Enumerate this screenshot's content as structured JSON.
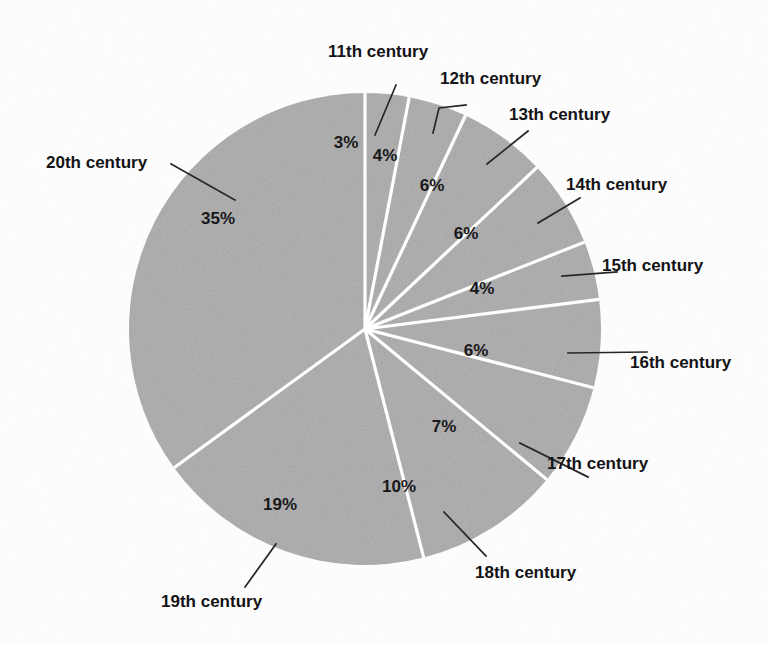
{
  "chart_data": {
    "type": "pie",
    "title": "",
    "subtitle": "",
    "xlabel": "",
    "ylabel": "",
    "legend_position": "none",
    "grid": false,
    "value_unit": "%",
    "start_angle_deg": 0,
    "direction": "clockwise",
    "categories": [
      "11th century",
      "12th century",
      "13th century",
      "14th century",
      "15th century",
      "16th century",
      "17th century",
      "18th century",
      "19th century",
      "20th century"
    ],
    "values": [
      3,
      4,
      6,
      6,
      4,
      6,
      7,
      10,
      19,
      35
    ],
    "value_labels": [
      "3%",
      "4%",
      "6%",
      "6%",
      "4%",
      "6%",
      "7%",
      "10%",
      "19%",
      "35%"
    ],
    "total": 100,
    "slice_color": "#a9a9a9",
    "separator_color": "#ffffff",
    "label_color": "#18181a",
    "leader_color": "#262628",
    "background_color": "#fdfdfd"
  },
  "geometry": {
    "center_x": 365,
    "center_y": 329,
    "radius": 236
  },
  "slices": [
    {
      "name": "11th century",
      "label": "11th century",
      "percent_label": "3%",
      "value": 3,
      "pct_x": 346,
      "pct_y": 148,
      "cat_x": 328,
      "cat_y": 57,
      "cat_anchor": "start",
      "leader": "M 375,135 L 396,85"
    },
    {
      "name": "12th century",
      "label": "12th century",
      "percent_label": "4%",
      "value": 4,
      "pct_x": 385,
      "pct_y": 161,
      "cat_x": 440,
      "cat_y": 84,
      "cat_anchor": "start",
      "leader": "M 433,133 L 439,108 L 466,105"
    },
    {
      "name": "13th century",
      "label": "13th century",
      "percent_label": "6%",
      "value": 6,
      "pct_x": 432,
      "pct_y": 191,
      "cat_x": 509,
      "cat_y": 120,
      "cat_anchor": "start",
      "leader": "M 487,164 L 528,131"
    },
    {
      "name": "14th century",
      "label": "14th century",
      "percent_label": "6%",
      "value": 6,
      "pct_x": 466,
      "pct_y": 239,
      "cat_x": 566,
      "cat_y": 190,
      "cat_anchor": "start",
      "leader": "M 538,223 L 580,198"
    },
    {
      "name": "15th century",
      "label": "15th century",
      "percent_label": "4%",
      "value": 4,
      "pct_x": 482,
      "pct_y": 294,
      "cat_x": 602,
      "cat_y": 271,
      "cat_anchor": "start",
      "leader": "M 562,276 L 617,272"
    },
    {
      "name": "16th century",
      "label": "16th century",
      "percent_label": "6%",
      "value": 6,
      "pct_x": 476,
      "pct_y": 356,
      "cat_x": 630,
      "cat_y": 368,
      "cat_anchor": "start",
      "leader": "M 568,353 L 647,352"
    },
    {
      "name": "17th century",
      "label": "17th century",
      "percent_label": "7%",
      "value": 7,
      "pct_x": 444,
      "pct_y": 432,
      "cat_x": 547,
      "cat_y": 469,
      "cat_anchor": "start",
      "leader": "M 520,443 L 588,477"
    },
    {
      "name": "18th century",
      "label": "18th century",
      "percent_label": "10%",
      "value": 10,
      "pct_x": 399,
      "pct_y": 492,
      "cat_x": 475,
      "cat_y": 578,
      "cat_anchor": "start",
      "leader": "M 444,512 L 486,556"
    },
    {
      "name": "19th century",
      "label": "19th century",
      "percent_label": "19%",
      "value": 19,
      "pct_x": 280,
      "pct_y": 510,
      "cat_x": 161,
      "cat_y": 607,
      "cat_anchor": "start",
      "leader": "M 276,544 L 245,587"
    },
    {
      "name": "20th century",
      "label": "20th century",
      "percent_label": "35%",
      "value": 35,
      "pct_x": 218,
      "pct_y": 224,
      "cat_x": 46,
      "cat_y": 168,
      "cat_anchor": "start",
      "leader": "M 235,200 L 171,164"
    }
  ]
}
